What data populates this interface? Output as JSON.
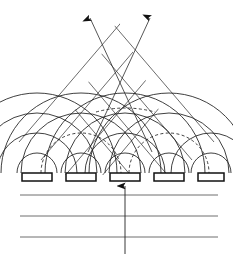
{
  "figure": {
    "title": "Phased array antenna radiating two grating-lobe beams",
    "caption": "",
    "width": 233,
    "height": 254,
    "background_color": "#ffffff",
    "line_color": "#1e1e1e"
  },
  "diagram_data": {
    "type": "technical-line-diagram",
    "subject": "phased-array-antenna-huygens-wavelets",
    "array": {
      "element_count": 5,
      "element_label": "radiating element",
      "element_width": 30,
      "element_height": 8,
      "element_spacing": 44,
      "baseline_y": 181,
      "elements": [
        {
          "index": 1,
          "x": 22,
          "y": 173,
          "w": 30,
          "h": 8,
          "center_x": 37
        },
        {
          "index": 2,
          "x": 66,
          "y": 173,
          "w": 30,
          "h": 8,
          "center_x": 81
        },
        {
          "index": 3,
          "x": 110,
          "y": 173,
          "w": 30,
          "h": 8,
          "center_x": 125
        },
        {
          "index": 4,
          "x": 154,
          "y": 173,
          "w": 30,
          "h": 8,
          "center_x": 169
        },
        {
          "index": 5,
          "x": 198,
          "y": 173,
          "w": 26,
          "h": 8,
          "center_x": 211
        }
      ]
    },
    "feed": {
      "label": "input feed arrow",
      "direction": "up",
      "x": 125,
      "y_start": 254,
      "y_tip": 182
    },
    "ground_lines": {
      "label": "feed network layers",
      "count": 3,
      "x_start": 20,
      "x_end": 218,
      "y_values": [
        195,
        216,
        237
      ]
    },
    "wavelets": {
      "label": "Huygens circular wavelets",
      "sources": [
        37,
        81,
        125,
        169,
        211
      ],
      "source_y": 173,
      "radii": [
        20,
        40,
        60,
        80
      ],
      "solid_style": "solid",
      "hidden_style": "dashed"
    },
    "beams": [
      {
        "name": "left-beam",
        "label": "grating lobe (left)",
        "angle_deg": -40,
        "arrow_tip": {
          "x": 88,
          "y": 14
        },
        "arrow_tail": {
          "x": 152,
          "y": 152
        },
        "wavefront_count": 5,
        "wavefront_spacing": 21
      },
      {
        "name": "right-beam",
        "label": "grating lobe (right)",
        "angle_deg": 40,
        "arrow_tip": {
          "x": 152,
          "y": 14
        },
        "arrow_tail": {
          "x": 86,
          "y": 152
        },
        "wavefront_count": 5,
        "wavefront_spacing": 21
      }
    ],
    "wavefront_lines": {
      "left_set_label": "left wavefront set",
      "right_set_label": "right wavefront set",
      "count_per_set": 5
    }
  }
}
